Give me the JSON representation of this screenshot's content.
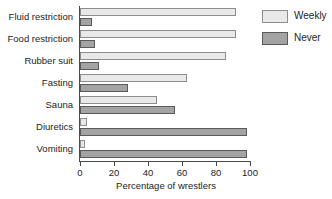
{
  "chart_data": {
    "type": "bar",
    "orientation": "horizontal",
    "title": "",
    "xlabel": "Percentage of wrestlers",
    "ylabel": "",
    "xlim": [
      0,
      100
    ],
    "xticks": [
      0,
      20,
      40,
      60,
      80,
      100
    ],
    "xtick_labels": [
      "0",
      "20",
      "40",
      "60",
      "80",
      "100"
    ],
    "grid": false,
    "legend_position": "top-right",
    "categories": [
      "Fluid restriction",
      "Food restriction",
      "Rubber suit",
      "Fasting",
      "Sauna",
      "Diuretics",
      "Vomiting"
    ],
    "series": [
      {
        "name": "Weekly",
        "color": "#e9e9e9",
        "values": [
          92,
          92,
          86,
          63,
          45,
          4,
          3
        ]
      },
      {
        "name": "Never",
        "color": "#a3a3a3",
        "values": [
          7,
          9,
          11,
          28,
          56,
          98,
          98
        ]
      }
    ]
  },
  "legend": {
    "items": [
      {
        "label": "Weekly"
      },
      {
        "label": "Never"
      }
    ]
  },
  "axis": {
    "x_title": "Percentage of wrestlers",
    "tick_labels": [
      "0",
      "20",
      "40",
      "60",
      "80",
      "100"
    ]
  }
}
